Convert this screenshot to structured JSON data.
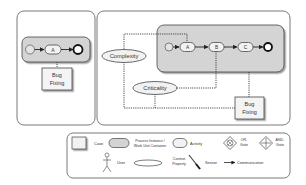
{
  "colors": {
    "panel_border": "#7a7a7a",
    "container_fill": "#d4d4d4",
    "activity_fill": "#f2f2f2",
    "line": "#222222",
    "text": "#333333"
  },
  "left_panel": {
    "activities": [
      {
        "label": "A"
      }
    ],
    "user_box": {
      "line1": "Bug",
      "line2": "Fixing"
    }
  },
  "right_panel": {
    "activities": [
      {
        "label": "A"
      },
      {
        "label": "B"
      },
      {
        "label": "C"
      }
    ],
    "contexts": [
      {
        "label": "Complexity"
      },
      {
        "label": "Criticality"
      }
    ],
    "user_box": {
      "line1": "Bug",
      "line2": "Fixing"
    }
  },
  "legend": {
    "case": "Case",
    "process_instance_line1": "Process Instance /",
    "process_instance_line2": "Work Unit Container",
    "activity": "Activity",
    "or_gate_line1": "OR-",
    "or_gate_line2": "Gate",
    "and_gate_line1": "AND-",
    "and_gate_line2": "Gate",
    "user": "User",
    "context_line1": "Context",
    "context_line2": "Property",
    "sensor": "Sensor",
    "communication": "Communication"
  }
}
